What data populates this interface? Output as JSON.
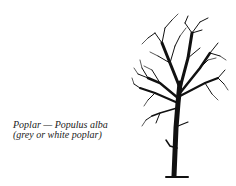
{
  "caption": {
    "line1": "Poplar — Populus alba",
    "line2": "(grey or white poplar)"
  },
  "illustration": {
    "subject": "poplar-tree-icon",
    "color": "#111111"
  }
}
